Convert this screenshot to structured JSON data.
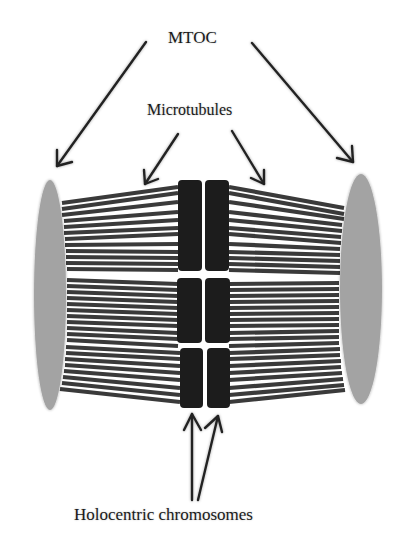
{
  "labels": {
    "mtoc": "MTOC",
    "microtubules": "Microtubules",
    "holocentric": "Holocentric chromosomes"
  },
  "colors": {
    "mtoc_fill": "#a3a3a3",
    "microtubule": "#3a3a3a",
    "chromosome": "#1c1c1c",
    "arrow": "#222222",
    "background": "#ffffff"
  },
  "structures": {
    "mtoc_count": 2,
    "chromosome_pairs": 3,
    "sister_chromatids_per_pair": 2
  }
}
